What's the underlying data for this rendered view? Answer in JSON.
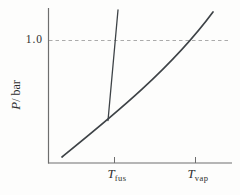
{
  "figure": {
    "ytick_label": "1.0",
    "ylabel_var": "P",
    "ylabel_unit": "/ bar",
    "xtick_fus_var": "T",
    "xtick_fus_sub": "fus",
    "xtick_vap_var": "T",
    "xtick_vap_sub": "vap"
  },
  "colors": {
    "curve": "#3e4347",
    "axis": "#6e6e6e",
    "dashed": "#ababab",
    "text": "#2e2e2e",
    "background": "#fdfdfc"
  },
  "chart_data": {
    "type": "line",
    "title": "",
    "xlabel": "T (temperature, unlabeled axis; ticks at T_fus and T_vap)",
    "ylabel": "P / bar",
    "yticks": [
      1.0
    ],
    "xtick_labels": [
      "T_fus",
      "T_vap"
    ],
    "grid": false,
    "legend": "none",
    "reference_line": {
      "P": 1.0,
      "style": "dashed",
      "orientation": "horizontal"
    },
    "series": [
      {
        "name": "fusion-curve",
        "shape": "straight steep line rising from the triple point",
        "points_px": [
          [
            108,
            120.5
          ],
          [
            118,
            10
          ]
        ],
        "crosses_reference_at": "T_fus"
      },
      {
        "name": "sublimation-vaporization-curve",
        "shape": "smooth concave-up curve from lower left through triple point to upper right",
        "bezier_px": [
          [
            62,
            157
          ],
          [
            110,
            118
          ],
          [
            170,
            70
          ],
          [
            213,
            12
          ]
        ],
        "crosses_reference_at": "T_vap"
      }
    ],
    "triple_point_px": [
      108,
      120.5
    ],
    "axes_px": {
      "origin": [
        48,
        163
      ],
      "x_end": 232,
      "y_top": 8,
      "dashed_y": 40,
      "dashed_x_end": 228,
      "tick_xs": [
        114.5,
        195.5
      ]
    }
  }
}
